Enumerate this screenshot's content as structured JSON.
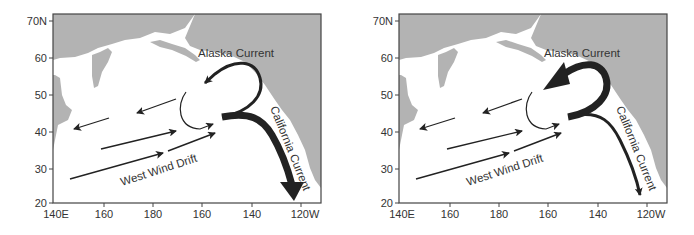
{
  "figure": {
    "panels": [
      {
        "id": "left",
        "variant": "strong-california-current",
        "labels": {
          "alaska": "Alaska Current",
          "california": "California Current",
          "westwind": "West Wind Drift"
        }
      },
      {
        "id": "right",
        "variant": "strong-alaska-current",
        "labels": {
          "alaska": "Alaska Current",
          "california": "California Current",
          "westwind": "West Wind Drift"
        }
      }
    ],
    "y_ticks": [
      "70N",
      "60",
      "50",
      "40",
      "30",
      "20"
    ],
    "x_ticks": [
      "140E",
      "160",
      "180",
      "160",
      "140",
      "120W"
    ],
    "colors": {
      "land": "#b3b3b3",
      "ocean": "#ffffff",
      "arrows": "#222222",
      "text": "#333333"
    }
  }
}
